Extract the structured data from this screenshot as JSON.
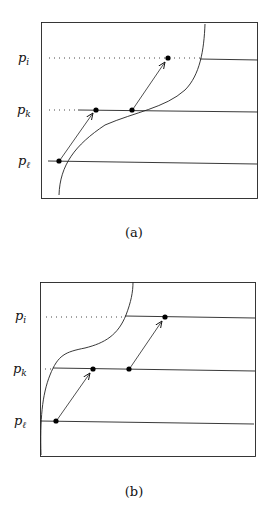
{
  "panels": [
    {
      "id": "a",
      "caption": "(a)",
      "labels": {
        "p_i": "p",
        "p_i_sub": "i",
        "p_k": "p",
        "p_k_sub": "k",
        "p_l": "p",
        "p_l_sub": "ℓ"
      }
    },
    {
      "id": "b",
      "caption": "(b)",
      "labels": {
        "p_i": "p",
        "p_i_sub": "i",
        "p_k": "p",
        "p_k_sub": "k",
        "p_l": "p",
        "p_l_sub": "ℓ"
      }
    }
  ]
}
